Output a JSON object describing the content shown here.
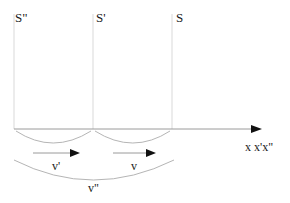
{
  "diagram": {
    "type": "reference-frames-velocity-addition",
    "frames": [
      {
        "label": "S\"",
        "x": 14
      },
      {
        "label": "S'",
        "x": 93
      },
      {
        "label": "S",
        "x": 172
      }
    ],
    "axis": {
      "label": "x x'x\"",
      "y": 129,
      "x_start": 14,
      "x_end": 260
    },
    "velocities": [
      {
        "label": "v'",
        "from_frame": "S\"",
        "to_frame": "S'"
      },
      {
        "label": "v",
        "from_frame": "S'",
        "to_frame": "S"
      },
      {
        "label": "v\"",
        "from_frame": "S\"",
        "to_frame": "S"
      }
    ],
    "colors": {
      "frame_line": "#e2e2e2",
      "axis_line": "#9a9a9a",
      "arc": "#b5b5b5",
      "arrow_head": "#111111",
      "text": "#1a1a1a"
    }
  }
}
